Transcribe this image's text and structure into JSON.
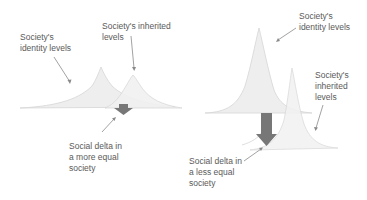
{
  "left_panel": {
    "identity_label": "Society's\nidentity levels",
    "inherited_label": "Society's inherited\nlevels",
    "delta_label": "Social delta in\na more equal\nsociety"
  },
  "right_panel": {
    "identity_label": "Society's\nidentity levels",
    "inherited_label": "Society's\ninherited\nlevels",
    "delta_label": "Social delta in\na less equal\nsociety"
  },
  "colors": {
    "curve_fill": "#ececec",
    "curve_stroke": "#d4d4d4",
    "arrow_fill": "#7a7a7a",
    "pointer_line": "#8a8a8a",
    "text": "#5a5a5a"
  }
}
